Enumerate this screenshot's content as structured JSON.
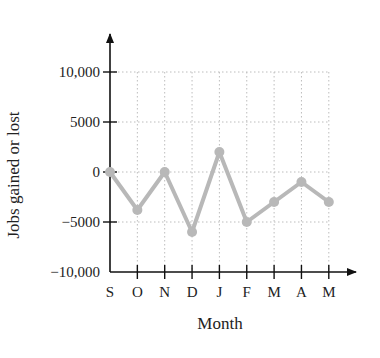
{
  "chart_data": {
    "type": "line",
    "title": "",
    "xlabel": "Month",
    "ylabel": "Jobs gained or lost",
    "categories": [
      "S",
      "O",
      "N",
      "D",
      "J",
      "F",
      "M",
      "A",
      "M"
    ],
    "values": [
      0,
      -3800,
      0,
      -6000,
      2000,
      -5000,
      -3000,
      -1000,
      -3000
    ],
    "series": [
      {
        "name": "Jobs gained or lost",
        "values": [
          0,
          -3800,
          0,
          -6000,
          2000,
          -5000,
          -3000,
          -1000,
          -3000
        ]
      }
    ],
    "ylim": [
      -10000,
      10000
    ],
    "yticks": [
      10000,
      5000,
      0,
      -5000,
      -10000
    ],
    "ytick_labels": [
      "10,000",
      "5000",
      "0",
      "−5000",
      "−10,000"
    ],
    "grid": true,
    "grid_style": "dotted",
    "legend": "none",
    "colors": {
      "line": "#b8b8b8",
      "marker": "#b8b8b8",
      "axis": "#111111",
      "grid": "#bdbdbd"
    }
  }
}
